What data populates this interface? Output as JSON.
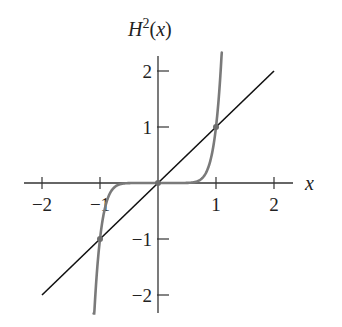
{
  "chart_data": {
    "type": "line",
    "title_parts": {
      "base": "H",
      "sup": "2",
      "arg": "(x)"
    },
    "xlabel": "x",
    "ylabel": "H^2(x)",
    "xlim": [
      -2.2,
      2.3
    ],
    "ylim": [
      -2.3,
      2.3
    ],
    "x_ticks": [
      -2,
      -1,
      1,
      2
    ],
    "x_tick_labels": [
      "−2",
      "−1",
      "1",
      "2"
    ],
    "y_ticks": [
      2,
      1,
      -1,
      -2
    ],
    "y_tick_labels": [
      "2",
      "1",
      "−1",
      "−2"
    ],
    "grid": false,
    "legend": null,
    "series": [
      {
        "name": "y = x",
        "color": "#111111",
        "x": [
          -2,
          2
        ],
        "y": [
          -2,
          2
        ]
      },
      {
        "name": "H^2(x) (approx. x^9)",
        "color": "#7a7a7a",
        "x": [
          -1.12,
          -1.05,
          -1.0,
          -0.95,
          -0.9,
          -0.85,
          -0.8,
          -0.7,
          -0.6,
          -0.4,
          0,
          0.4,
          0.6,
          0.7,
          0.8,
          0.85,
          0.9,
          0.95,
          1.0,
          1.05,
          1.1
        ],
        "y": [
          -2.77,
          -1.55,
          -1.0,
          -0.63,
          -0.39,
          -0.23,
          -0.13,
          -0.04,
          -0.01,
          0.0,
          0,
          0.0,
          0.01,
          0.04,
          0.13,
          0.23,
          0.39,
          0.63,
          1.0,
          1.55,
          2.36
        ]
      }
    ],
    "fixed_points": [
      {
        "x": -1,
        "y": -1
      },
      {
        "x": 0,
        "y": 0
      },
      {
        "x": 1,
        "y": 1
      }
    ]
  }
}
